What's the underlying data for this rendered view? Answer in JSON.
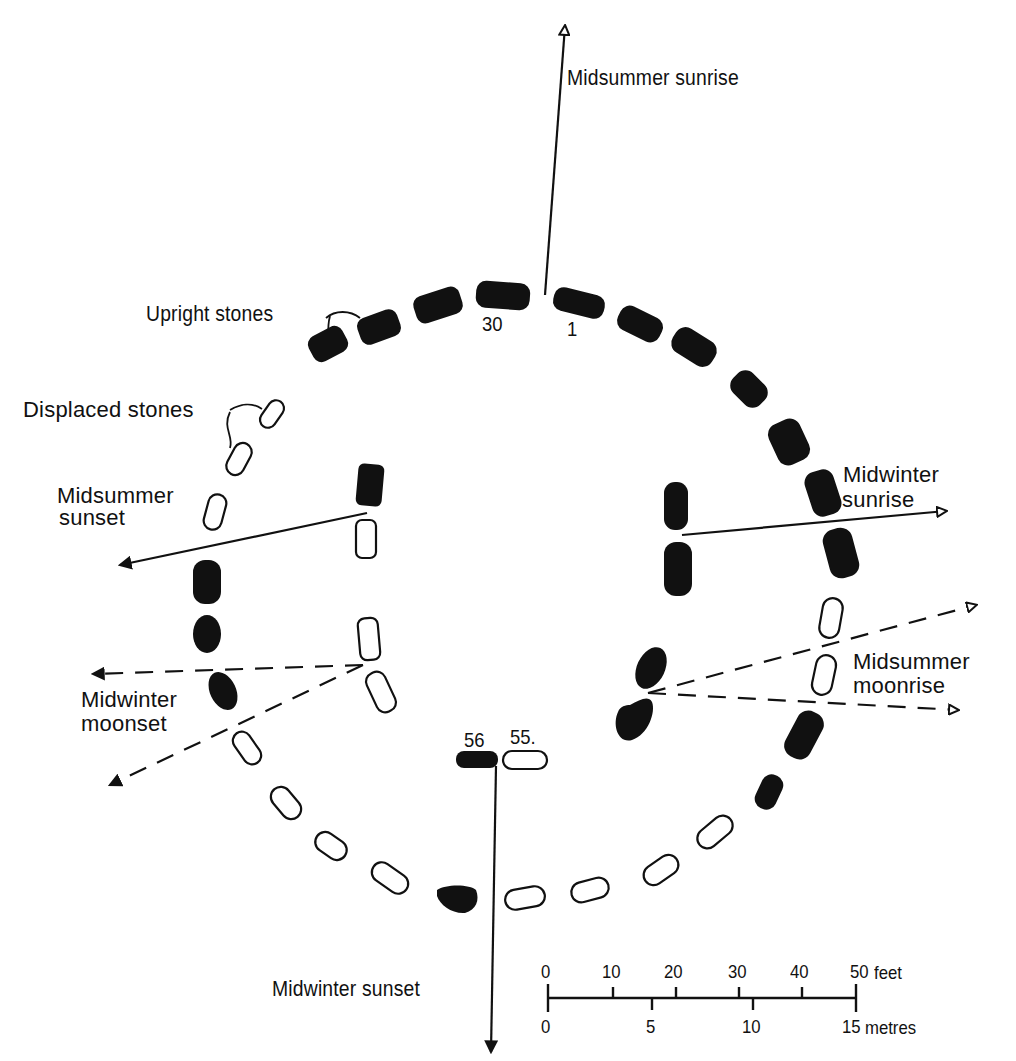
{
  "colors": {
    "ink": "#111111",
    "background": "#ffffff"
  },
  "labels": {
    "midsummer_sunrise": "Midsummer sunrise",
    "upright_stones": "Upright stones",
    "displaced_stones": "Displaced stones",
    "midsummer_sunset_1": "Midsummer",
    "midsummer_sunset_2": "sunset",
    "midwinter_sunrise_1": "Midwinter",
    "midwinter_sunrise_2": "sunrise",
    "midwinter_moonset_1": "Midwinter",
    "midwinter_moonset_2": "moonset",
    "midsummer_moonrise_1": "Midsummer",
    "midsummer_moonrise_2": "moonrise",
    "midwinter_sunset": "Midwinter sunset"
  },
  "stone_numbers": {
    "s30": "30",
    "s1": "1",
    "s56": "56",
    "s55": "55."
  },
  "legend": {
    "upright": "Upright stones (filled)",
    "displaced": "Displaced stones (outline)"
  },
  "alignments": [
    {
      "name": "Midsummer sunrise",
      "style": "solid",
      "arrow": "open"
    },
    {
      "name": "Midsummer sunset",
      "style": "solid",
      "arrow": "filled"
    },
    {
      "name": "Midwinter sunrise",
      "style": "solid",
      "arrow": "open"
    },
    {
      "name": "Midwinter sunset",
      "style": "solid",
      "arrow": "filled"
    },
    {
      "name": "Midwinter moonset",
      "style": "dashed",
      "arrow": "filled"
    },
    {
      "name": "Midsummer moonrise",
      "style": "dashed",
      "arrow": "open"
    }
  ],
  "scale_bar": {
    "feet_ticks": [
      "0",
      "10",
      "20",
      "30",
      "40",
      "50"
    ],
    "feet_unit": "feet",
    "metre_ticks": [
      "0",
      "5",
      "10",
      "15"
    ],
    "metre_unit": "metres"
  }
}
